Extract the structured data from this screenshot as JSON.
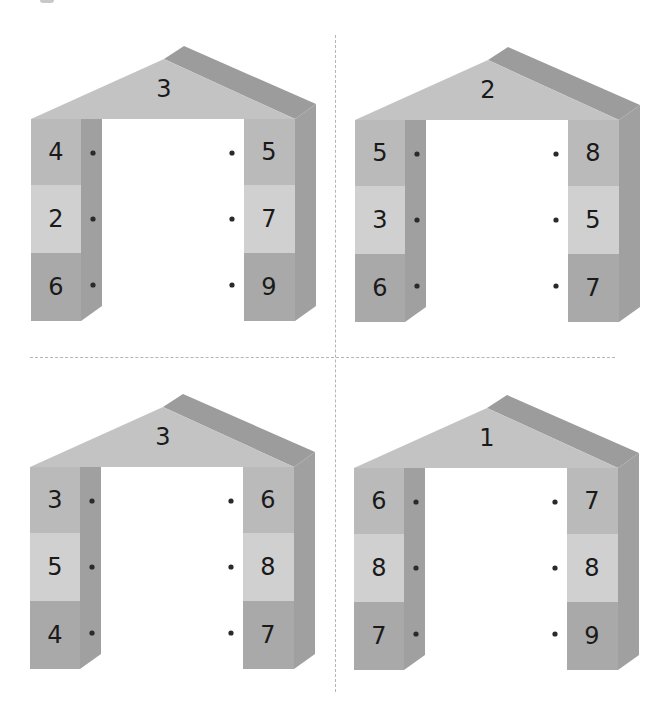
{
  "worksheet": {
    "colors": {
      "roof_front": "#c3c3c3",
      "roof_top": "#9c9c9c",
      "block_top": "#bababa",
      "block_middle": "#d0d0d0",
      "block_bottom": "#a9a9a9",
      "side_face": "#a0a0a0",
      "dot": "#2a2a2a",
      "divider": "#b5b5b5"
    },
    "houses": [
      {
        "roof": "3",
        "left": [
          "4",
          "2",
          "6"
        ],
        "right": [
          "5",
          "7",
          "9"
        ]
      },
      {
        "roof": "2",
        "left": [
          "5",
          "3",
          "6"
        ],
        "right": [
          "8",
          "5",
          "7"
        ]
      },
      {
        "roof": "3",
        "left": [
          "3",
          "5",
          "4"
        ],
        "right": [
          "6",
          "8",
          "7"
        ]
      },
      {
        "roof": "1",
        "left": [
          "6",
          "8",
          "7"
        ],
        "right": [
          "7",
          "8",
          "9"
        ]
      }
    ]
  }
}
